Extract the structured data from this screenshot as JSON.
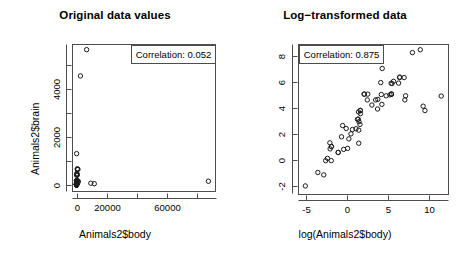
{
  "figure": {
    "background": "#ffffff",
    "point_color": "#1a1a1a",
    "axis_color": "#4d4d4d",
    "panels": 2
  },
  "chart_data": [
    {
      "type": "scatter",
      "panel": "left",
      "title": "Original data values",
      "xlabel": "Animals2$body",
      "ylabel": "Animals2$brain",
      "xlim": [
        -3000,
        92000
      ],
      "ylim": [
        -300,
        5950
      ],
      "xticks": [
        0,
        20000,
        40000,
        60000,
        80000
      ],
      "xtick_labels": [
        "0",
        "20000",
        "",
        "60000",
        ""
      ],
      "yticks": [
        0,
        1000,
        2000,
        3000,
        4000,
        5000
      ],
      "ytick_labels": [
        "0",
        "",
        "2000",
        "",
        "4000",
        ""
      ],
      "grid": false,
      "point_style": "open-circle",
      "annotation": {
        "label": "Correlation: 0.052",
        "position": "top-right"
      },
      "x": [
        1.35,
        465,
        36.33,
        27.66,
        1.04,
        11700,
        2547,
        187.1,
        521,
        10.0,
        3.3,
        529,
        207,
        62,
        6654,
        9400,
        6.8,
        35,
        0.12,
        0.023,
        2.5,
        55.5,
        100,
        52.16,
        87000,
        0.122,
        192,
        3.385,
        192,
        1100,
        0.28,
        4.235,
        6.8,
        0.75,
        3.5,
        4.05,
        17.5,
        250,
        0.48,
        10.55,
        0.55,
        60,
        3.6,
        4.288,
        0.28,
        0.075,
        0.122,
        0.048,
        192,
        3.0,
        160,
        0.9,
        1.62,
        0.104,
        4.235,
        0.425,
        0.101,
        920,
        1000,
        0.005,
        0.06,
        3.5
      ],
      "y": [
        8.1,
        423,
        119.5,
        115,
        5.5,
        50,
        4603,
        419,
        655,
        115,
        25.6,
        680,
        406,
        1320,
        5712,
        70,
        179,
        56,
        1,
        0.4,
        12.1,
        175,
        157,
        440,
        154.5,
        3,
        180,
        44.5,
        180,
        157,
        1.9,
        50.4,
        179,
        12.3,
        3.9,
        17,
        77,
        490,
        15.5,
        179.5,
        2.4,
        81,
        21,
        39.2,
        1.9,
        1.2,
        3,
        0.33,
        180,
        25,
        169,
        2.6,
        11.4,
        2.5,
        50.4,
        6.4,
        4,
        655,
        115,
        0.14,
        1.0,
        10.8
      ]
    },
    {
      "type": "scatter",
      "panel": "right",
      "title": "Log−transformed data",
      "xlabel": "log(Animals2$body)",
      "ylabel": "log(Animals2$brain)",
      "xlim": [
        -6.2,
        12.2
      ],
      "ylim": [
        -2.6,
        9.1
      ],
      "xticks": [
        -5,
        0,
        5,
        10
      ],
      "xtick_labels": [
        "-5",
        "0",
        "5",
        "10"
      ],
      "yticks": [
        -2,
        0,
        2,
        4,
        6,
        8
      ],
      "ytick_labels": [
        "-2",
        "0",
        "2",
        "4",
        "6",
        "8"
      ],
      "grid": false,
      "point_style": "open-circle",
      "annotation": {
        "label": "Correlation: 0.875",
        "position": "top-left"
      },
      "x": [
        0.3,
        6.14,
        3.59,
        3.32,
        0.04,
        9.37,
        7.84,
        5.23,
        6.26,
        2.3,
        1.19,
        6.27,
        5.33,
        4.13,
        8.8,
        9.15,
        1.92,
        3.56,
        -2.12,
        -3.77,
        0.92,
        4.02,
        4.61,
        3.95,
        11.37,
        -2.1,
        5.26,
        1.22,
        5.26,
        7.0,
        -1.27,
        1.44,
        1.92,
        -0.29,
        1.25,
        1.4,
        2.86,
        5.52,
        -0.73,
        2.36,
        -0.6,
        4.09,
        1.28,
        1.46,
        -1.27,
        -2.59,
        -2.1,
        -3.04,
        5.26,
        1.1,
        5.08,
        -0.11,
        0.48,
        -2.26,
        1.44,
        -0.86,
        -2.29,
        6.82,
        6.91,
        -5.3,
        -2.81,
        1.25
      ],
      "y": [
        2.09,
        6.05,
        4.78,
        4.74,
        1.7,
        3.91,
        8.43,
        6.04,
        6.48,
        4.74,
        3.24,
        6.52,
        6.01,
        7.19,
        8.65,
        4.25,
        5.19,
        4.03,
        0.0,
        -0.92,
        2.49,
        5.16,
        5.06,
        6.09,
        5.04,
        1.1,
        5.19,
        3.8,
        5.19,
        5.06,
        0.64,
        3.92,
        5.19,
        2.51,
        1.36,
        2.83,
        4.34,
        6.19,
        2.74,
        5.19,
        0.88,
        4.39,
        3.04,
        3.67,
        0.64,
        0.18,
        1.1,
        -1.11,
        5.19,
        3.22,
        5.13,
        0.96,
        2.43,
        0.92,
        3.92,
        1.86,
        1.39,
        6.48,
        4.74,
        -1.97,
        0.0,
        2.38
      ]
    }
  ]
}
